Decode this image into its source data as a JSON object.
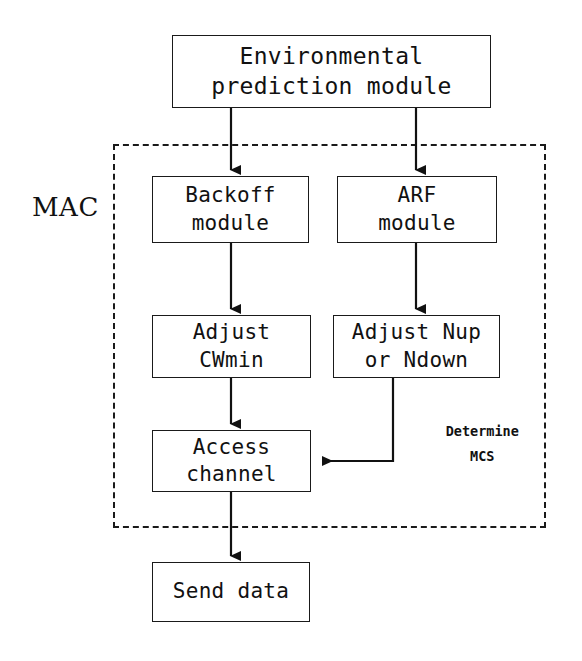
{
  "diagram": {
    "title_region": {
      "label": "MAC"
    },
    "nodes": {
      "env_prediction": {
        "line1": "Environmental",
        "line2": "prediction module"
      },
      "backoff": {
        "line1": "Backoff",
        "line2": "module"
      },
      "arf": {
        "line1": "ARF",
        "line2": "module"
      },
      "adjust_cwmin": {
        "line1": "Adjust",
        "line2": "CWmin"
      },
      "adjust_nup": {
        "line1": "Adjust Nup",
        "line2": "or Ndown"
      },
      "access_channel": {
        "line1": "Access",
        "line2": "channel"
      },
      "send_data": {
        "line1": "Send data",
        "line2": ""
      }
    },
    "edge_labels": {
      "determine_mcs_line1": "Determine",
      "determine_mcs_line2": "MCS"
    },
    "colors": {
      "stroke": "#1a1a1a",
      "text": "#111111",
      "background": "#ffffff"
    }
  }
}
